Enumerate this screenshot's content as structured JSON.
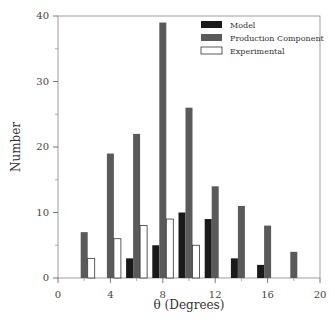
{
  "chart_data": {
    "type": "bar",
    "title": "",
    "xlabel": "θ (Degrees)",
    "ylabel": "Number",
    "xlim": [
      0,
      20
    ],
    "ylim": [
      0,
      40
    ],
    "x_ticks": [
      0,
      4,
      8,
      12,
      16,
      20
    ],
    "y_ticks": [
      0,
      10,
      20,
      30,
      40
    ],
    "y_minor_ticks": [
      5,
      15,
      25,
      35
    ],
    "grid": false,
    "legend_position": "upper right",
    "categories": [
      2,
      4,
      6,
      8,
      10,
      12,
      14,
      16,
      18
    ],
    "series": [
      {
        "name": "Model",
        "color": "#1a1a1a",
        "values": [
          0,
          0,
          3,
          5,
          10,
          9,
          3,
          2,
          0
        ]
      },
      {
        "name": "Production Component",
        "color": "#5a5a5a",
        "values": [
          7,
          19,
          22,
          39,
          26,
          14,
          11,
          8,
          4
        ]
      },
      {
        "name": "Experimental",
        "color": "#ffffff",
        "values": [
          3,
          6,
          8,
          9,
          5,
          0,
          0,
          0,
          0
        ]
      }
    ]
  }
}
